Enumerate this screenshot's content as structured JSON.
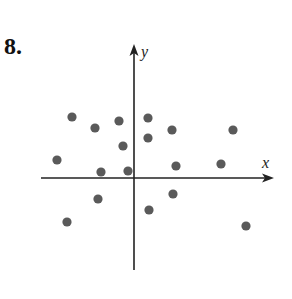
{
  "problem": {
    "number": "8."
  },
  "chart_data": {
    "type": "scatter",
    "title": "",
    "xlabel": "x",
    "ylabel": "y",
    "grid": false,
    "legend": null,
    "axes": {
      "x_tick_labels": [],
      "y_tick_labels": [],
      "arrows": true
    },
    "point_color": "#5a5a5a",
    "axis_color": "#222222",
    "pixel_frame": {
      "origin_px": [
        134,
        178
      ],
      "x_axis_px": [
        41,
        273
      ],
      "y_axis_px": [
        45,
        270
      ]
    },
    "points": [
      {
        "x": -62,
        "y": 61
      },
      {
        "x": -39,
        "y": 50
      },
      {
        "x": -15,
        "y": 57
      },
      {
        "x": 14,
        "y": 60
      },
      {
        "x": 38,
        "y": 48
      },
      {
        "x": 99,
        "y": 48
      },
      {
        "x": 14,
        "y": 40
      },
      {
        "x": -11,
        "y": 32
      },
      {
        "x": -77,
        "y": 18
      },
      {
        "x": -33,
        "y": 6
      },
      {
        "x": -6,
        "y": 7
      },
      {
        "x": 42,
        "y": 12
      },
      {
        "x": 87,
        "y": 14
      },
      {
        "x": -36,
        "y": -21
      },
      {
        "x": 39,
        "y": -16
      },
      {
        "x": 15,
        "y": -32
      },
      {
        "x": -67,
        "y": -44
      },
      {
        "x": 112,
        "y": -48
      }
    ]
  }
}
